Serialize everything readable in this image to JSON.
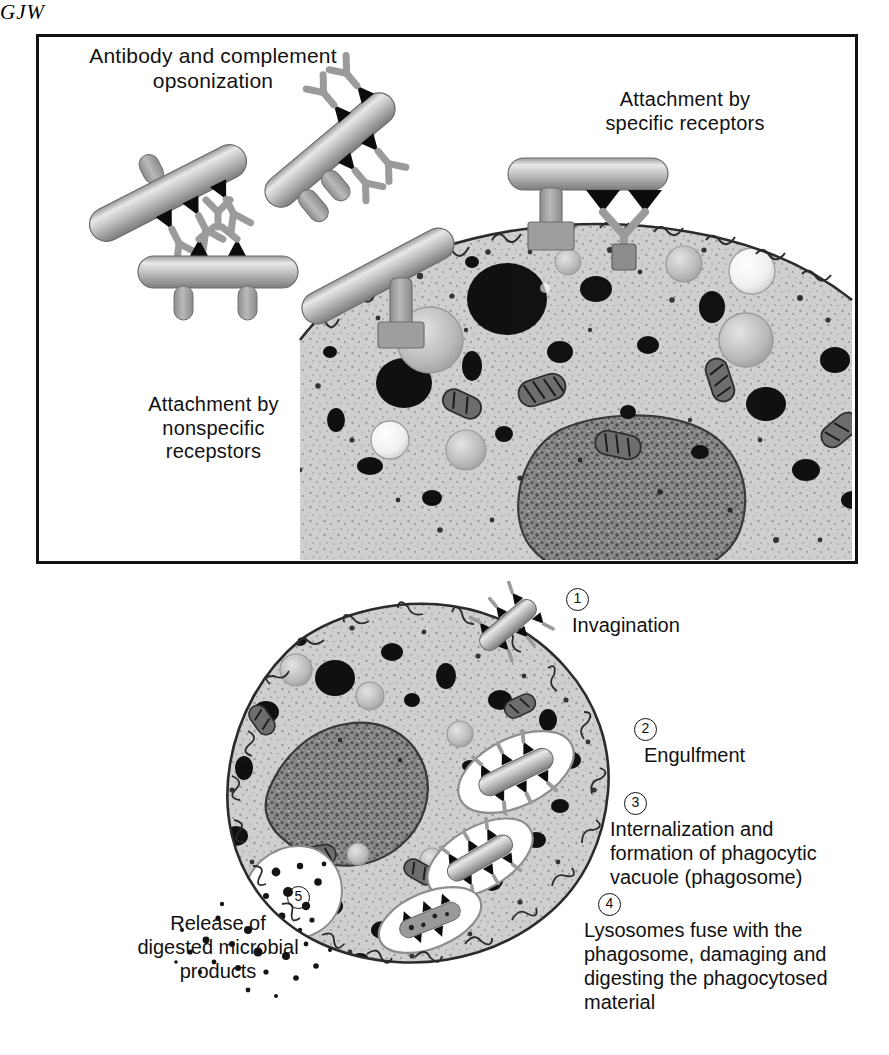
{
  "figure": {
    "signature": "GJW",
    "domain_type": "biology-illustration"
  },
  "top_panel": {
    "caption_opsonization": "Antibody and complement\nopsonization",
    "caption_specific_receptors": "Attachment by\nspecific receptors",
    "caption_nonspecific_receptors": "Attachment by\nnonspecific\nrecepstors"
  },
  "steps": [
    {
      "number": "1",
      "label": "Invagination"
    },
    {
      "number": "2",
      "label": "Engulfment"
    },
    {
      "number": "3",
      "label": "Internalization and\nformation of phagocytic\nvacuole (phagosome)"
    },
    {
      "number": "4",
      "label": "Lysosomes fuse with the\nphagosome, damaging and\ndigesting the phagocytosed\nmaterial"
    },
    {
      "number": "5",
      "label": "Release of\ndigested microbial\nproducts"
    }
  ],
  "elements": {
    "bacterium": "rod-shaped-bacterium",
    "antibody": "y-shaped-antibody",
    "complement": "complement-triangle",
    "specific_receptor": "specific-receptor-peg",
    "nonspecific_receptor": "nonspecific-receptor-peg",
    "phagocyte": "phagocyte-cell",
    "nucleus": "cell-nucleus",
    "mitochondrion": "mitochondrion",
    "lysosome": "lysosome-granule",
    "vacuole": "phagocytic-vacuole",
    "debris": "digested-debris"
  },
  "colors": {
    "ink": "#111111",
    "cytoplasm": "#c9c9c9",
    "cytoplasm_light": "#d8d8d8",
    "nucleus": "#6f6f6f",
    "membrane": "#2b2b2b",
    "bacterium_body": "#b5b5b5",
    "bacterium_shade": "#8e8e8e",
    "granule_dark": "#141414",
    "granule_mid": "#7a7a7a",
    "vacuole_fill": "#ffffff",
    "background": "#ffffff"
  }
}
